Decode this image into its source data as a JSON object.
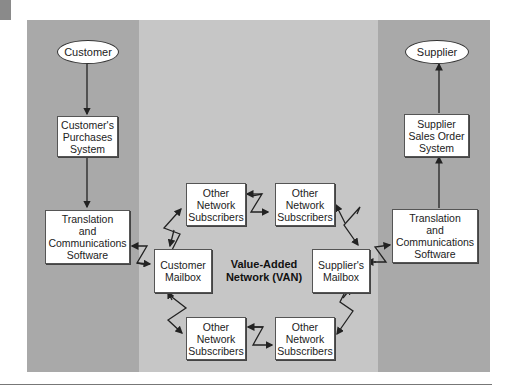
{
  "diagram": {
    "type": "flowchart",
    "title": "Value-Added Network (VAN)",
    "columns": {
      "left": "Customer side",
      "middle": "Value-Added Network (VAN)",
      "right": "Supplier side"
    },
    "nodes": {
      "customer": "Customer",
      "supplier": "Supplier",
      "customer_purchases": "Customer's\nPurchases\nSystem",
      "supplier_sales": "Supplier\nSales Order\nSystem",
      "trans_left": "Translation\nand\nCommunications\nSoftware",
      "trans_right": "Translation\nand\nCommunications\nSoftware",
      "customer_mailbox": "Customer\nMailbox",
      "supplier_mailbox": "Supplier's\nMailbox",
      "other_tl": "Other\nNetwork\nSubscribers",
      "other_tr": "Other\nNetwork\nSubscribers",
      "other_bl": "Other\nNetwork\nSubscribers",
      "other_br": "Other\nNetwork\nSubscribers",
      "van_label": "Value-Added\nNetwork (VAN)"
    },
    "edges": [
      {
        "from": "Customer",
        "to": "Customer's Purchases System",
        "style": "straight"
      },
      {
        "from": "Customer's Purchases System",
        "to": "Translation and Communications Software (customer)",
        "style": "straight"
      },
      {
        "from": "Translation and Communications Software (customer)",
        "to": "Customer Mailbox",
        "style": "lightning-bidirectional"
      },
      {
        "from": "Customer Mailbox",
        "to": "Other Network Subscribers (top-left)",
        "style": "lightning-bidirectional"
      },
      {
        "from": "Other Network Subscribers (top-left)",
        "to": "Other Network Subscribers (top-right)",
        "style": "lightning-bidirectional"
      },
      {
        "from": "Other Network Subscribers (top-right)",
        "to": "Supplier's Mailbox",
        "style": "lightning-bidirectional"
      },
      {
        "from": "Customer Mailbox",
        "to": "Other Network Subscribers (bottom-left)",
        "style": "lightning-bidirectional"
      },
      {
        "from": "Other Network Subscribers (bottom-left)",
        "to": "Other Network Subscribers (bottom-right)",
        "style": "lightning-bidirectional"
      },
      {
        "from": "Other Network Subscribers (bottom-right)",
        "to": "Supplier's Mailbox",
        "style": "lightning-bidirectional"
      },
      {
        "from": "Supplier's Mailbox",
        "to": "Translation and Communications Software (supplier)",
        "style": "lightning-bidirectional"
      },
      {
        "from": "Translation and Communications Software (supplier)",
        "to": "Supplier Sales Order System",
        "style": "straight"
      },
      {
        "from": "Supplier Sales Order System",
        "to": "Supplier",
        "style": "straight"
      }
    ],
    "colors": {
      "side_columns": "#a9a9a9",
      "middle_column": "#c6c6c6",
      "box_fill": "#ffffff",
      "line": "#222222"
    }
  }
}
